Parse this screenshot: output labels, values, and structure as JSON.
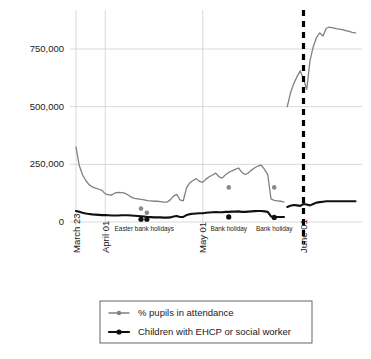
{
  "chart_data": {
    "type": "line",
    "title": "",
    "subtitle": "",
    "xlabel": "",
    "ylabel": "",
    "ylim": [
      0,
      900000
    ],
    "yticks": [
      0,
      250000,
      500000,
      750000
    ],
    "ytick_labels": [
      "0",
      "250,000",
      "500,000",
      "750,000"
    ],
    "grid": "horizontal-and-vertical-at-xticks",
    "legend_position": "below-plot-center",
    "xtick_labels": [
      "March 23",
      "April 01",
      "May 01",
      "June 01"
    ],
    "xtick_values": [
      0,
      9,
      39,
      70
    ],
    "x_range": [
      0,
      88
    ],
    "series": [
      {
        "name": "% pupils in attendance",
        "color": "#808080",
        "x": [
          0,
          1,
          2,
          3,
          4,
          5,
          6,
          7,
          8,
          9,
          10,
          11,
          12,
          13,
          14,
          15,
          16,
          17,
          18,
          19,
          20,
          21,
          22,
          23,
          24,
          25,
          26,
          27,
          28,
          29,
          30,
          31,
          32,
          33,
          34,
          35,
          36,
          37,
          38,
          39,
          40,
          41,
          42,
          43,
          44,
          45,
          46,
          47,
          48,
          49,
          50,
          51,
          52,
          53,
          54,
          55,
          56,
          57,
          58,
          59,
          60,
          61,
          62,
          63,
          64,
          65,
          66,
          67,
          68,
          69,
          70,
          71,
          72,
          73,
          74,
          75,
          76,
          77,
          78,
          79,
          80,
          81,
          82,
          83,
          84,
          85,
          86
        ],
        "values": [
          325000,
          245000,
          205000,
          180000,
          162000,
          152000,
          147000,
          142000,
          137000,
          122000,
          118000,
          117000,
          126000,
          128000,
          127000,
          125000,
          117000,
          108000,
          102000,
          100000,
          98000,
          96000,
          93000,
          92000,
          90000,
          90000,
          88000,
          86000,
          86000,
          96000,
          112000,
          120000,
          96000,
          92000,
          148000,
          170000,
          180000,
          188000,
          176000,
          172000,
          186000,
          196000,
          204000,
          212000,
          196000,
          190000,
          205000,
          215000,
          222000,
          228000,
          234000,
          216000,
          206000,
          212000,
          225000,
          235000,
          243000,
          246000,
          228000,
          205000,
          100000,
          94000,
          92000,
          90000,
          86000,
          500000,
          560000,
          600000,
          630000,
          655000,
          620000,
          575000,
          700000,
          760000,
          800000,
          820000,
          806000,
          840000,
          845000,
          842000,
          838000,
          836000,
          834000,
          830000,
          826000,
          822000,
          820000
        ]
      },
      {
        "name": "Children with EHCP or social worker",
        "color": "#101010",
        "x": [
          0,
          1,
          2,
          3,
          4,
          5,
          6,
          7,
          8,
          9,
          10,
          11,
          12,
          13,
          14,
          15,
          16,
          17,
          18,
          19,
          20,
          21,
          22,
          23,
          24,
          25,
          26,
          27,
          28,
          29,
          30,
          31,
          32,
          33,
          34,
          35,
          36,
          37,
          38,
          39,
          40,
          41,
          42,
          43,
          44,
          45,
          46,
          47,
          48,
          49,
          50,
          51,
          52,
          53,
          54,
          55,
          56,
          57,
          58,
          59,
          60,
          61,
          62,
          63,
          64,
          65,
          66,
          67,
          68,
          69,
          70,
          71,
          72,
          73,
          74,
          75,
          76,
          77,
          78,
          79,
          80,
          81,
          82,
          83,
          84,
          85,
          86
        ],
        "values": [
          48000,
          44000,
          40000,
          37000,
          35000,
          33000,
          32000,
          31000,
          30000,
          30000,
          29000,
          28000,
          28000,
          28000,
          29000,
          29000,
          29000,
          28000,
          27000,
          26000,
          25000,
          24000,
          22000,
          21000,
          20000,
          20000,
          20000,
          19000,
          19000,
          20000,
          24000,
          26000,
          22000,
          22000,
          30000,
          34000,
          36000,
          37000,
          38000,
          38000,
          40000,
          41000,
          42000,
          43000,
          42000,
          42000,
          44000,
          44000,
          45000,
          45000,
          46000,
          44000,
          44000,
          45000,
          46000,
          47000,
          48000,
          48000,
          46000,
          44000,
          24000,
          22000,
          22000,
          22000,
          22000,
          65000,
          70000,
          74000,
          72000,
          70000,
          78000,
          76000,
          72000,
          78000,
          84000,
          86000,
          88000,
          90000,
          90000,
          90000,
          90000,
          90000,
          90000,
          90000,
          90000,
          90000,
          90000
        ]
      }
    ],
    "event_markers": {
      "grey_points": [
        {
          "x": 20,
          "y": 58000
        },
        {
          "x": 21.8,
          "y": 40000
        },
        {
          "x": 47,
          "y": 150000
        },
        {
          "x": 61,
          "y": 150000
        }
      ],
      "black_points": [
        {
          "x": 20,
          "y": 12000
        },
        {
          "x": 21.8,
          "y": 12000
        },
        {
          "x": 47,
          "y": 22000
        },
        {
          "x": 61,
          "y": 20000
        }
      ]
    },
    "annotations": [
      {
        "label": "Easter bank holidays",
        "x": 21
      },
      {
        "label": "Bank holiday",
        "x": 47
      },
      {
        "label": "Bank holiday",
        "x": 61
      }
    ],
    "reference_line": {
      "label": "June 01",
      "x": 70,
      "style": "dashed",
      "color": "#000000"
    }
  },
  "legend": {
    "items": [
      {
        "label": "% pupils in attendance",
        "color": "#808080"
      },
      {
        "label": "Children with EHCP or social worker",
        "color": "#101010"
      }
    ]
  }
}
